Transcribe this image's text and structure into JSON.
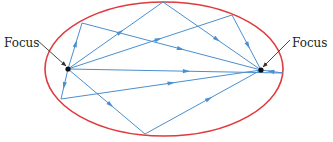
{
  "diagram": {
    "colors": {
      "ellipse": "#e03a3e",
      "rays": "#4a8fcf",
      "focus": "#111111",
      "pointer": "#333333",
      "text": "#231f20"
    },
    "ellipse": {
      "cx": 164,
      "cy": 69,
      "rx": 119,
      "ry": 67
    },
    "foci": [
      {
        "id": "left",
        "label": "Focus",
        "x": 68,
        "y": 69,
        "label_x": 4,
        "label_y": 43
      },
      {
        "id": "right",
        "label": "Focus",
        "x": 261,
        "y": 70,
        "label_x": 292,
        "label_y": 43
      }
    ],
    "rays": [
      {
        "from": [
          68,
          69
        ],
        "via": [
          82,
          23
        ],
        "to": [
          261,
          70
        ]
      },
      {
        "from": [
          68,
          69
        ],
        "via": [
          163,
          2
        ],
        "to": [
          261,
          70
        ]
      },
      {
        "from": [
          68,
          69
        ],
        "via": [
          232,
          15
        ],
        "to": [
          261,
          70
        ]
      },
      {
        "from": [
          68,
          69
        ],
        "via": [
          283,
          73
        ],
        "to": [
          261,
          70
        ]
      },
      {
        "from": [
          68,
          69
        ],
        "via": [
          61,
          99
        ],
        "to": [
          261,
          70
        ]
      },
      {
        "from": [
          68,
          69
        ],
        "via": [
          145,
          134
        ],
        "to": [
          261,
          70
        ]
      }
    ]
  }
}
